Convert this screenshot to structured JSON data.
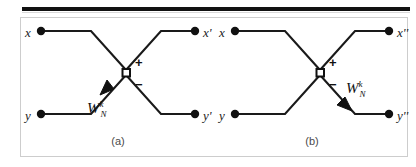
{
  "figure": {
    "frame_border_color": "#cdcdcd",
    "rule_color": "#111111",
    "line_color": "#1a1a1a",
    "node_fill": "#ffffff"
  },
  "diagrams": [
    {
      "id": "a",
      "caption": "(a)",
      "inputs": [
        {
          "name": "x-input",
          "label": "x"
        },
        {
          "name": "y-input",
          "label": "y"
        }
      ],
      "outputs": [
        {
          "name": "x-prime-output",
          "label": "x'"
        },
        {
          "name": "y-prime-output",
          "label": "y'"
        }
      ],
      "signs": [
        {
          "name": "plus-sign",
          "label": "+"
        },
        {
          "name": "minus-sign",
          "label": "−"
        }
      ],
      "twiddle": {
        "base": "W",
        "superscript": "k",
        "subscript": "N",
        "arrow_direction": "toward-node"
      }
    },
    {
      "id": "b",
      "caption": "(b)",
      "inputs": [
        {
          "name": "x-input",
          "label": "x"
        },
        {
          "name": "y-input",
          "label": "y"
        }
      ],
      "outputs": [
        {
          "name": "x-double-prime-output",
          "label": "x''"
        },
        {
          "name": "y-double-prime-output",
          "label": "y''"
        }
      ],
      "signs": [
        {
          "name": "plus-sign",
          "label": "+"
        },
        {
          "name": "minus-sign",
          "label": "−"
        }
      ],
      "twiddle": {
        "base": "W",
        "superscript": "k",
        "subscript": "N",
        "arrow_direction": "away-from-node"
      }
    }
  ]
}
